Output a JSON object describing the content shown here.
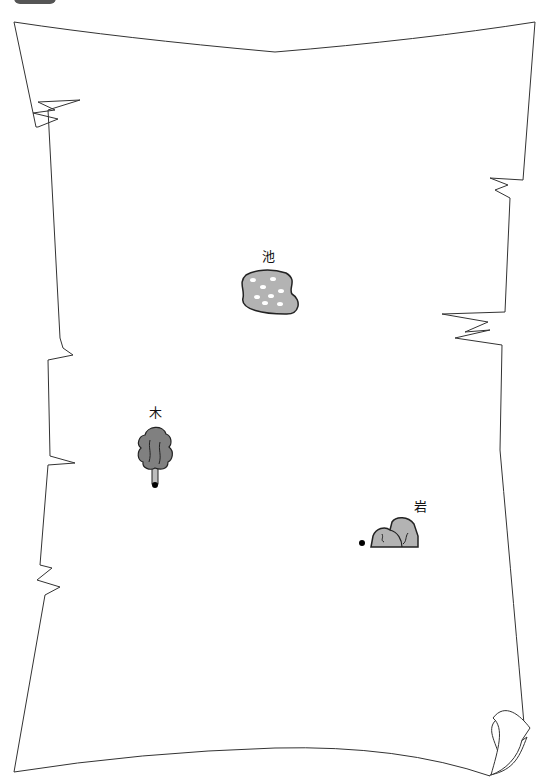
{
  "map": {
    "type": "parchment-scroll-map",
    "background_color": "#ffffff",
    "border_color": "#333333",
    "fill_gray": "#b3b3b3",
    "tree_gray": "#808080"
  },
  "features": [
    {
      "id": "pond",
      "label": "池",
      "icon": "pond-icon"
    },
    {
      "id": "tree",
      "label": "木",
      "icon": "tree-icon"
    },
    {
      "id": "rock",
      "label": "岩",
      "icon": "rock-icon"
    }
  ],
  "markers": [
    {
      "id": "tree-marker",
      "near": "tree"
    },
    {
      "id": "rock-marker",
      "near": "rock"
    }
  ]
}
